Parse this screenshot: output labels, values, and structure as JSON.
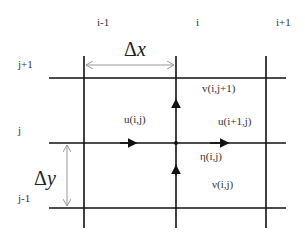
{
  "column_labels": [
    "i-1",
    "i",
    "i+1"
  ],
  "row_labels": [
    "j+1",
    "j",
    "j-1"
  ],
  "spacing": {
    "dx_symbol": "Δ",
    "dx_var": "x",
    "dy_symbol": "Δ",
    "dy_var": "y"
  },
  "variables": {
    "v_top": "v(i,j+1)",
    "u_left": "u(i,j)",
    "u_right": "u(i+1,j)",
    "eta": "η(i,j)",
    "nu": "ν(i,j)"
  },
  "colors": {
    "grid_line": "#111111",
    "dimension_line": "#999999",
    "text": "#333333"
  }
}
